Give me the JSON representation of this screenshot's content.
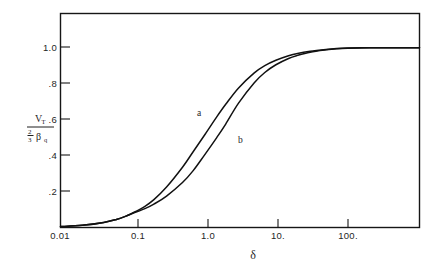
{
  "figure": {
    "background_color": "#ffffff",
    "line_color": "#111111",
    "axis_color": "#161616"
  },
  "axes": {
    "x": {
      "title": "δ",
      "scale": "log",
      "tick_labels": [
        "0.01",
        "0.1",
        "1.0",
        "10.",
        "100."
      ],
      "tick_values": [
        0.01,
        0.1,
        1,
        10,
        100
      ],
      "range": [
        0.01,
        1000
      ]
    },
    "y": {
      "title_numerator": "V",
      "title_numerator_sub": "T",
      "title_denominator_frac_num": "2",
      "title_denominator_frac_den": "3",
      "title_denominator_sym": "β",
      "title_denominator_sub": "q",
      "tick_labels": [
        "1.0",
        ".8",
        ".6",
        ".4",
        ".2"
      ],
      "tick_values": [
        1.0,
        0.8,
        0.6,
        0.4,
        0.2
      ],
      "range": [
        0,
        1.19
      ]
    }
  },
  "annotations": [
    {
      "name": "curve-label-a",
      "text": "a",
      "x_px": 197,
      "y_px": 116
    },
    {
      "name": "curve-label-b",
      "text": "b",
      "x_px": 238,
      "y_px": 143
    }
  ],
  "chart_data": {
    "type": "line",
    "title": "",
    "xlabel": "δ",
    "ylabel": "V_T / ((2/3) β q)",
    "xscale": "log",
    "xlim": [
      0.01,
      1000
    ],
    "ylim": [
      0,
      1.19
    ],
    "grid": false,
    "legend": "inline-curve-labels",
    "xticks": [
      0.01,
      0.1,
      1,
      10,
      100
    ],
    "xticklabels": [
      "0.01",
      "0.1",
      "1.0",
      "10.",
      "100."
    ],
    "yticks": [
      0.2,
      0.4,
      0.6,
      0.8,
      1.0
    ],
    "yticklabels": [
      ".2",
      ".4",
      ".6",
      ".8",
      "1.0"
    ],
    "series": [
      {
        "name": "a",
        "label": "a",
        "x": [
          0.01,
          0.02,
          0.04,
          0.06,
          0.08,
          0.1,
          0.15,
          0.2,
          0.3,
          0.5,
          0.7,
          1.0,
          1.5,
          2.0,
          3.0,
          5.0,
          7.0,
          10.0,
          15.0,
          20.0,
          30.0,
          50.0,
          70.0,
          100.0,
          200.0,
          400.0,
          1000.0
        ],
        "y": [
          0.005,
          0.012,
          0.028,
          0.045,
          0.062,
          0.08,
          0.118,
          0.155,
          0.225,
          0.335,
          0.42,
          0.51,
          0.615,
          0.685,
          0.775,
          0.86,
          0.9,
          0.93,
          0.955,
          0.968,
          0.98,
          0.99,
          0.995,
          0.998,
          1.0,
          1.0,
          1.0
        ]
      },
      {
        "name": "b",
        "label": "b",
        "x": [
          0.01,
          0.02,
          0.04,
          0.06,
          0.08,
          0.1,
          0.15,
          0.2,
          0.3,
          0.5,
          0.7,
          1.0,
          1.5,
          2.0,
          3.0,
          5.0,
          7.0,
          10.0,
          15.0,
          20.0,
          30.0,
          50.0,
          70.0,
          100.0,
          200.0,
          400.0,
          1000.0
        ],
        "y": [
          0.005,
          0.012,
          0.028,
          0.045,
          0.062,
          0.078,
          0.105,
          0.13,
          0.175,
          0.25,
          0.315,
          0.4,
          0.5,
          0.575,
          0.69,
          0.805,
          0.862,
          0.905,
          0.94,
          0.957,
          0.975,
          0.988,
          0.994,
          0.997,
          1.0,
          1.0,
          1.0
        ]
      }
    ]
  }
}
